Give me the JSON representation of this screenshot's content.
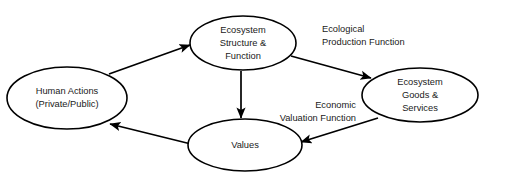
{
  "diagram": {
    "background_color": "#ffffff",
    "stroke_color": "#000000",
    "text_color": "#1a1a1a",
    "nodes": [
      {
        "id": "human-actions",
        "lines": [
          "Human Actions",
          "(Private/Public)"
        ],
        "line1": "Human Actions",
        "line2": "(Private/Public)",
        "cx": 67,
        "cy": 98,
        "rx": 60,
        "ry": 31
      },
      {
        "id": "ecosystem-structure-function",
        "lines": [
          "Ecosystem",
          "Structure &",
          "Function"
        ],
        "line1": "Ecosystem",
        "line2": "Structure &",
        "line3": "Function",
        "cx": 243,
        "cy": 43,
        "rx": 53,
        "ry": 27
      },
      {
        "id": "ecosystem-goods-services",
        "lines": [
          "Ecosystem",
          "Goods &",
          "Services"
        ],
        "line1": "Ecosystem",
        "line2": "Goods &",
        "line3": "Services",
        "cx": 420,
        "cy": 95,
        "rx": 58,
        "ry": 27
      },
      {
        "id": "values",
        "lines": [
          "Values"
        ],
        "line1": "Values",
        "cx": 245,
        "cy": 145,
        "rx": 57,
        "ry": 26
      }
    ],
    "edge_labels": [
      {
        "id": "ecological-production-function",
        "line1": "Ecological",
        "line2": "Production Function",
        "x": 322,
        "y1": 32,
        "y2": 45,
        "align": "start"
      },
      {
        "id": "economic-valuation-function",
        "line1": "Economic",
        "line2": "Valuation Function",
        "x": 356,
        "y1": 108,
        "y2": 121,
        "align": "end"
      }
    ],
    "edges": [
      {
        "id": "human-actions-to-ecosystem-structure",
        "from": "human-actions",
        "to": "ecosystem-structure-function",
        "label": ""
      },
      {
        "id": "ecosystem-structure-to-ecosystem-goods",
        "from": "ecosystem-structure-function",
        "to": "ecosystem-goods-services",
        "label": "Ecological Production Function"
      },
      {
        "id": "ecosystem-structure-to-values",
        "from": "ecosystem-structure-function",
        "to": "values",
        "label": ""
      },
      {
        "id": "ecosystem-goods-to-values",
        "from": "ecosystem-goods-services",
        "to": "values",
        "label": "Economic Valuation Function"
      },
      {
        "id": "values-to-human-actions",
        "from": "values",
        "to": "human-actions",
        "label": ""
      }
    ]
  }
}
